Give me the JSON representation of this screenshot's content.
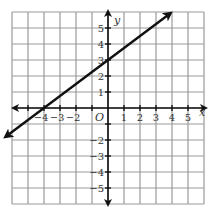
{
  "chart_data": {
    "type": "line",
    "title": "",
    "xlabel": "x",
    "ylabel": "y",
    "origin_label": "O",
    "xlim": [
      -6,
      6
    ],
    "ylim": [
      -6,
      6
    ],
    "grid": true,
    "x_tick_labels": [
      {
        "value": -4,
        "label": "−4"
      },
      {
        "value": -3,
        "label": "−3"
      },
      {
        "value": -2,
        "label": "−2"
      },
      {
        "value": 1,
        "label": "1"
      },
      {
        "value": 2,
        "label": "2"
      },
      {
        "value": 3,
        "label": "3"
      },
      {
        "value": 4,
        "label": "4"
      },
      {
        "value": 5,
        "label": "5"
      }
    ],
    "y_tick_labels": [
      {
        "value": 5,
        "label": "5"
      },
      {
        "value": 4,
        "label": "4"
      },
      {
        "value": 3,
        "label": "3"
      },
      {
        "value": 2,
        "label": "2"
      },
      {
        "value": 1,
        "label": "1"
      },
      {
        "value": -2,
        "label": "−2"
      },
      {
        "value": -3,
        "label": "−3"
      },
      {
        "value": -4,
        "label": "−4"
      },
      {
        "value": -5,
        "label": "−5"
      }
    ],
    "series": [
      {
        "name": "line",
        "equation": "y = 3/4 x + 3",
        "slope": 0.75,
        "intercept": 3,
        "x_intercept": -4,
        "points": [
          [
            -6.4,
            -1.8
          ],
          [
            -4,
            0
          ],
          [
            0,
            3
          ],
          [
            3.9,
            5.925
          ]
        ],
        "arrows_both_ends": true,
        "color": "#111111"
      }
    ]
  },
  "colors": {
    "grid": "#9a9a9a",
    "axis": "#111111",
    "line": "#111111",
    "text": "#333333"
  }
}
